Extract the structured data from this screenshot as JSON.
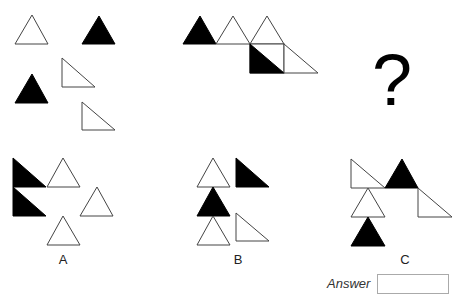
{
  "puzzle": {
    "question_mark": "?",
    "options": [
      {
        "label": "A"
      },
      {
        "label": "B"
      },
      {
        "label": "C"
      }
    ],
    "answer": {
      "label": "Answer",
      "value": ""
    },
    "colors": {
      "fill_black": "#000000",
      "stroke": "#444444",
      "background": "#ffffff"
    }
  }
}
